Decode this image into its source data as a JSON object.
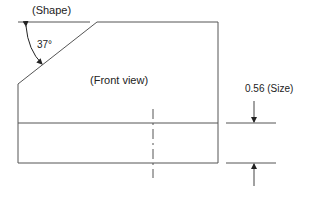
{
  "diagram": {
    "labels": {
      "shape": "(Shape)",
      "angle": "37°",
      "view": "(Front view)",
      "size": "0.56 (Size)"
    },
    "colors": {
      "line": "#555555",
      "text": "#222222",
      "background": "#ffffff"
    }
  }
}
